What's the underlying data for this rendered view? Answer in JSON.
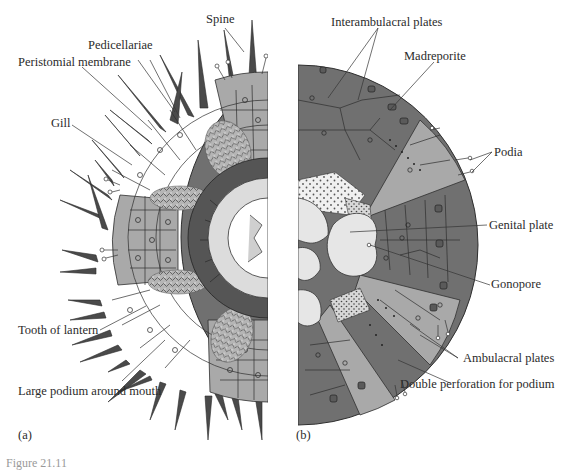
{
  "figure": {
    "panels": {
      "a": {
        "label": "(a)"
      },
      "b": {
        "label": "(b)"
      }
    },
    "caption_partial": "Figure 21.11",
    "colors": {
      "interambulacral": "#707070",
      "ambulacral": "#a9a9a9",
      "genital_plate": "#e6e6e6",
      "spine": "#4a4a4a",
      "outline": "#2e2e2e",
      "stipple_bg": "#efefef",
      "lantern": "#dcdcdc"
    },
    "labels_a": {
      "spine": "Spine",
      "pedicellariae": "Pedicellariae",
      "peristomial_membrane": "Peristomial membrane",
      "gill": "Gill",
      "tooth_of_lantern": "Tooth of lantern",
      "large_podium": "Large podium around mouth"
    },
    "labels_b": {
      "interambulacral_plates": "Interambulacral plates",
      "madreporite": "Madreporite",
      "podia": "Podia",
      "genital_plate": "Genital plate",
      "gonopore": "Gonopore",
      "ambulacral_plates": "Ambulacral plates",
      "double_perforation": "Double perforation for podium"
    }
  }
}
